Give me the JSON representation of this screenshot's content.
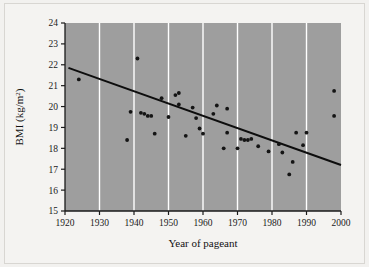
{
  "figure": {
    "background_color": "#f2f1ef",
    "plot_background_color": "#9e9e9e",
    "gridline_color": "#ffffff",
    "axis_color": "#1a1a1a",
    "point_color": "#141414",
    "trendline_color": "#0d0d0d"
  },
  "axis_titles": {
    "x": "Year of pageant",
    "y_main": "BMI (kg/m",
    "y_exponent": "2",
    "y_close": ")"
  },
  "chart_data": {
    "type": "scatter",
    "title": "",
    "xlabel": "Year of pageant",
    "ylabel": "BMI (kg/m^2)",
    "xlim": [
      1920,
      2000
    ],
    "ylim": [
      15,
      24
    ],
    "xticks": [
      1920,
      1930,
      1940,
      1950,
      1960,
      1970,
      1980,
      1990,
      2000
    ],
    "yticks": [
      15,
      16,
      17,
      18,
      19,
      20,
      21,
      22,
      23,
      24
    ],
    "grid": "vertical gridlines at each x tick, white",
    "legend": "none",
    "points": [
      {
        "x": 1924,
        "y": 21.3
      },
      {
        "x": 1938,
        "y": 18.4
      },
      {
        "x": 1939,
        "y": 19.75
      },
      {
        "x": 1941,
        "y": 22.3
      },
      {
        "x": 1942,
        "y": 19.7
      },
      {
        "x": 1943,
        "y": 19.65
      },
      {
        "x": 1944,
        "y": 19.55
      },
      {
        "x": 1945,
        "y": 19.55
      },
      {
        "x": 1946,
        "y": 18.7
      },
      {
        "x": 1948,
        "y": 20.4
      },
      {
        "x": 1950,
        "y": 19.5
      },
      {
        "x": 1952,
        "y": 20.55
      },
      {
        "x": 1953,
        "y": 20.65
      },
      {
        "x": 1953,
        "y": 20.1
      },
      {
        "x": 1955,
        "y": 18.6
      },
      {
        "x": 1957,
        "y": 19.95
      },
      {
        "x": 1958,
        "y": 19.45
      },
      {
        "x": 1959,
        "y": 18.95
      },
      {
        "x": 1960,
        "y": 18.7
      },
      {
        "x": 1963,
        "y": 19.65
      },
      {
        "x": 1964,
        "y": 20.05
      },
      {
        "x": 1966,
        "y": 18.0
      },
      {
        "x": 1967,
        "y": 18.75
      },
      {
        "x": 1967,
        "y": 19.9
      },
      {
        "x": 1970,
        "y": 18.0
      },
      {
        "x": 1971,
        "y": 18.45
      },
      {
        "x": 1972,
        "y": 18.4
      },
      {
        "x": 1973,
        "y": 18.4
      },
      {
        "x": 1974,
        "y": 18.45
      },
      {
        "x": 1976,
        "y": 18.1
      },
      {
        "x": 1979,
        "y": 17.85
      },
      {
        "x": 1982,
        "y": 18.2
      },
      {
        "x": 1983,
        "y": 17.8
      },
      {
        "x": 1985,
        "y": 16.75
      },
      {
        "x": 1986,
        "y": 17.35
      },
      {
        "x": 1987,
        "y": 18.75
      },
      {
        "x": 1989,
        "y": 18.15
      },
      {
        "x": 1990,
        "y": 18.75
      },
      {
        "x": 1998,
        "y": 20.75
      },
      {
        "x": 1998,
        "y": 19.55
      }
    ],
    "trendline": {
      "type": "linear-fit",
      "x_start": 1921,
      "y_start": 21.85,
      "x_end": 2000,
      "y_end": 17.2
    }
  }
}
